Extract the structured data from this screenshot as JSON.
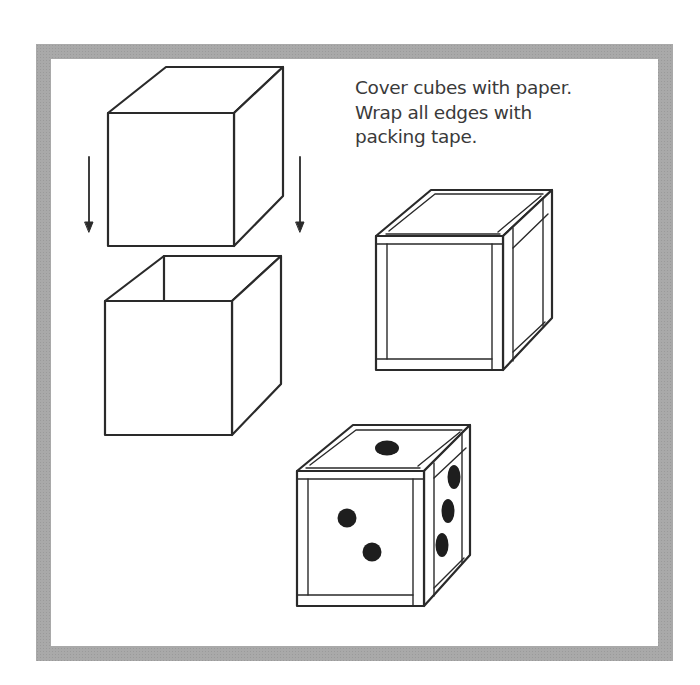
{
  "instructions": {
    "lines": [
      "Cover cubes with paper.",
      "Wrap all edges with",
      "packing tape."
    ]
  },
  "figures": {
    "lid_cube": {
      "label": "lid-cube"
    },
    "open_box": {
      "label": "open-box"
    },
    "taped_cube": {
      "label": "taped-cube"
    },
    "die": {
      "label": "die",
      "pips": {
        "top": 1,
        "front": 2,
        "right": 3
      }
    }
  },
  "colors": {
    "frame": "#a9a9a9",
    "line": "#2a2a2a",
    "pip": "#1e1e1e",
    "background": "#ffffff"
  }
}
